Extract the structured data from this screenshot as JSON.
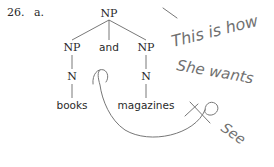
{
  "example": {
    "number": "26.",
    "letter": "a."
  },
  "tree": {
    "root": "NP",
    "children": [
      {
        "label": "NP",
        "child": "N",
        "leaf": "books"
      },
      {
        "label": "and"
      },
      {
        "label": "NP",
        "child": "N",
        "leaf": "magazines"
      }
    ]
  },
  "annotation": {
    "handwritten_lines": [
      "This is how",
      "She wants",
      "To see"
    ],
    "color": "#6a6a6a"
  }
}
